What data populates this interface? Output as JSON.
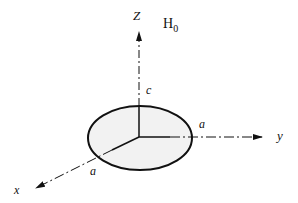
{
  "diagram": {
    "axes": {
      "z_label": "Z",
      "y_label": "y",
      "x_label": "x"
    },
    "field_label": "H",
    "field_subscript": "0",
    "semi_axes": {
      "c_label": "c",
      "a_y_label": "a",
      "a_x_label": "a"
    },
    "colors": {
      "stroke": "#111111",
      "ellipse_fill": "#f2f2f2",
      "background": "#ffffff"
    }
  }
}
